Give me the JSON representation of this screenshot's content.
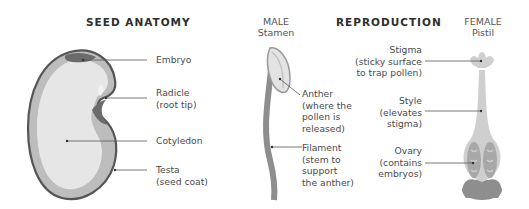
{
  "seed": {
    "title": "SEED ANATOMY",
    "labels": {
      "embryo": "Embryo",
      "radicle": "Radicle",
      "radicle_note": "(root tip)",
      "cotyledon": "Cotyledon",
      "testa": "Testa",
      "testa_note": "(seed coat)"
    }
  },
  "reproduction": {
    "title": "REPRODUCTION",
    "male": {
      "heading": "MALE",
      "sub": "Stamen",
      "anther": [
        "Anther",
        "(where the",
        "pollen is",
        "released)"
      ],
      "filament": [
        "Filament",
        "(stem to",
        "support",
        "the anther)"
      ]
    },
    "female": {
      "heading": "FEMALE",
      "sub": "Pistil",
      "stigma": [
        "Stigma",
        "(sticky surface",
        "to trap pollen)"
      ],
      "style": [
        "Style",
        "(elevates",
        "stigma)"
      ],
      "ovary": [
        "Ovary",
        "(contains",
        "embryos)"
      ]
    }
  },
  "colors": {
    "outline": "#555555",
    "coat": "#bdbdbd",
    "inner": "#e6e6e6",
    "light": "#d9d9d9",
    "dark": "#6b6b6b",
    "stem": "#8e8e8e"
  }
}
